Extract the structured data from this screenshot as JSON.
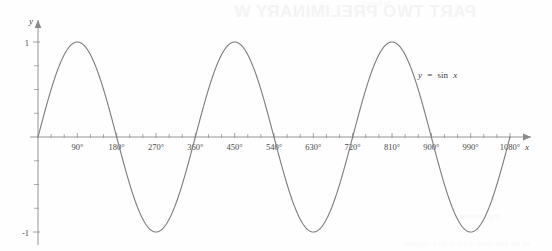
{
  "page": {
    "bleed_through_title": "PART TWO PRELIMINARY W",
    "bleed_through_subtitle": "in Book 1",
    "bleed_through_bottom": "trigonometric",
    "bleed_through_footer": "for the sine curve of the angle in degrees"
  },
  "colors": {
    "curve": "#808080",
    "axis": "#8a8a8a",
    "label": "#3f3f3f",
    "tick_label": "#4a4a4a",
    "background": "#fefefe"
  },
  "chart_data": {
    "type": "line",
    "title": "",
    "annotation": "y = sin x",
    "annotation_parts": {
      "y": "y",
      "equals": "=",
      "fn": "sin",
      "arg": "x"
    },
    "xlabel": "x",
    "ylabel": "y",
    "xlim": [
      -30,
      1140
    ],
    "ylim": [
      -1.35,
      1.35
    ],
    "grid": false,
    "legend": "none",
    "x_major_ticks": [
      90,
      180,
      270,
      360,
      450,
      540,
      630,
      720,
      810,
      900,
      990,
      1080
    ],
    "x_tick_labels": [
      "90°",
      "180°",
      "270°",
      "360°",
      "450°",
      "540°",
      "630°",
      "720°",
      "810°",
      "900°",
      "990°",
      "1080°"
    ],
    "x_minor_tick_step": 30,
    "y_major_ticks": [
      -1,
      1
    ],
    "y_tick_labels": [
      "-1",
      "1"
    ],
    "y_minor_tick_step": 0.25,
    "series": [
      {
        "name": "y = sin x",
        "equation": "y = sin(x)",
        "amplitude": 1,
        "period_degrees": 360,
        "x_start": 0,
        "x_end": 1080,
        "maxima_degrees": [
          90,
          450,
          810
        ],
        "minima_degrees": [
          270,
          630,
          990
        ],
        "zeros_degrees": [
          0,
          180,
          360,
          540,
          720,
          900,
          1080
        ],
        "sample_x": [
          0,
          30,
          60,
          90,
          120,
          150,
          180,
          210,
          240,
          270,
          300,
          330,
          360,
          390,
          420,
          450,
          480,
          510,
          540,
          570,
          600,
          630,
          660,
          690,
          720,
          750,
          780,
          810,
          840,
          870,
          900,
          930,
          960,
          990,
          1020,
          1050,
          1080
        ],
        "sample_y": [
          0,
          0.5,
          0.866,
          1,
          0.866,
          0.5,
          0,
          -0.5,
          -0.866,
          -1,
          -0.866,
          -0.5,
          0,
          0.5,
          0.866,
          1,
          0.866,
          0.5,
          0,
          -0.5,
          -0.866,
          -1,
          -0.866,
          -0.5,
          0,
          0.5,
          0.866,
          1,
          0.866,
          0.5,
          0,
          -0.5,
          -0.866,
          -1,
          -0.866,
          -0.5,
          0
        ]
      }
    ]
  }
}
